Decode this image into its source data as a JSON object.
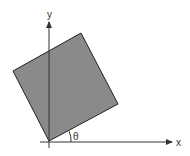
{
  "diagram": {
    "type": "rotated-square-on-axes",
    "axes": {
      "x_label": "x",
      "y_label": "y"
    },
    "angle_label": "θ",
    "colors": {
      "square_fill": "#8a8a8a",
      "square_stroke": "#222222",
      "axis": "#333333",
      "background": "#ffffff"
    }
  }
}
